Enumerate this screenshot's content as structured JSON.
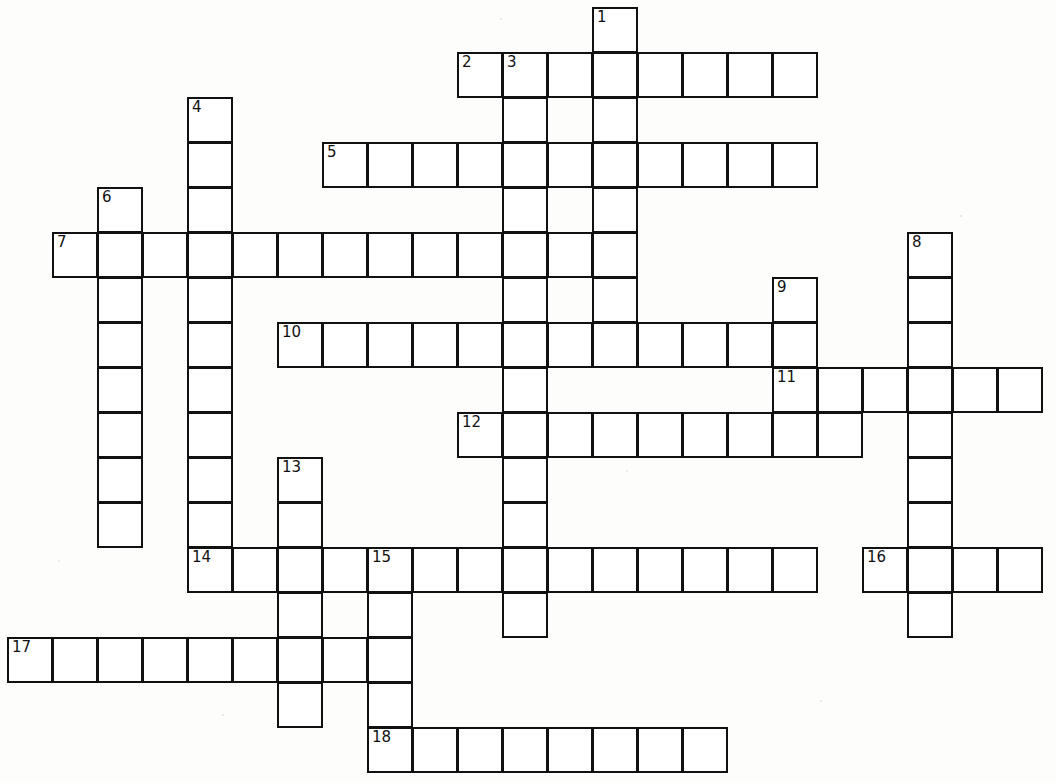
{
  "puzzle": {
    "type": "crossword-grid",
    "title": "",
    "grid": {
      "origin_x": 7,
      "origin_y": 7,
      "cell_size": 45,
      "cols": 23,
      "rows": 17,
      "line_color": "#111111",
      "cell_fill": "#ffffff",
      "background": "#fdfdfc"
    },
    "entries": [
      {
        "number": "1",
        "direction": "down",
        "row": 0,
        "col": 13,
        "length": 6
      },
      {
        "number": "2",
        "direction": "across",
        "row": 1,
        "col": 10,
        "length": 8
      },
      {
        "number": "3",
        "direction": "down",
        "row": 1,
        "col": 11,
        "length": 13
      },
      {
        "number": "4",
        "direction": "down",
        "row": 2,
        "col": 4,
        "length": 10
      },
      {
        "number": "5",
        "direction": "across",
        "row": 3,
        "col": 7,
        "length": 11
      },
      {
        "number": "6",
        "direction": "down",
        "row": 4,
        "col": 2,
        "length": 8
      },
      {
        "number": "7",
        "direction": "across",
        "row": 5,
        "col": 1,
        "length": 12
      },
      {
        "number": "8",
        "direction": "down",
        "row": 5,
        "col": 20,
        "length": 9
      },
      {
        "number": "9",
        "direction": "down",
        "row": 6,
        "col": 17,
        "length": 4
      },
      {
        "number": "10",
        "direction": "across",
        "row": 7,
        "col": 6,
        "length": 11
      },
      {
        "number": "11",
        "direction": "across",
        "row": 8,
        "col": 17,
        "length": 6
      },
      {
        "number": "12",
        "direction": "across",
        "row": 9,
        "col": 10,
        "length": 9
      },
      {
        "number": "13",
        "direction": "down",
        "row": 10,
        "col": 6,
        "length": 6
      },
      {
        "number": "14",
        "direction": "across",
        "row": 12,
        "col": 4,
        "length": 4
      },
      {
        "number": "15",
        "direction": "across",
        "row": 12,
        "col": 8,
        "length": 10
      },
      {
        "number": "15",
        "direction": "down",
        "row": 12,
        "col": 8,
        "length": 5
      },
      {
        "number": "16",
        "direction": "across",
        "row": 12,
        "col": 19,
        "length": 3
      },
      {
        "number": "17",
        "direction": "across",
        "row": 14,
        "col": 0,
        "length": 8
      },
      {
        "number": "18",
        "direction": "across",
        "row": 16,
        "col": 8,
        "length": 8
      }
    ],
    "cells": [
      {
        "row": 0,
        "col": 13,
        "num": "1"
      },
      {
        "row": 1,
        "col": 10,
        "num": "2"
      },
      {
        "row": 1,
        "col": 11,
        "num": "3"
      },
      {
        "row": 1,
        "col": 12,
        "num": ""
      },
      {
        "row": 1,
        "col": 13,
        "num": ""
      },
      {
        "row": 1,
        "col": 14,
        "num": ""
      },
      {
        "row": 1,
        "col": 15,
        "num": ""
      },
      {
        "row": 1,
        "col": 16,
        "num": ""
      },
      {
        "row": 1,
        "col": 17,
        "num": ""
      },
      {
        "row": 2,
        "col": 4,
        "num": "4"
      },
      {
        "row": 2,
        "col": 11,
        "num": ""
      },
      {
        "row": 2,
        "col": 13,
        "num": ""
      },
      {
        "row": 3,
        "col": 4,
        "num": ""
      },
      {
        "row": 3,
        "col": 7,
        "num": "5"
      },
      {
        "row": 3,
        "col": 8,
        "num": ""
      },
      {
        "row": 3,
        "col": 9,
        "num": ""
      },
      {
        "row": 3,
        "col": 10,
        "num": ""
      },
      {
        "row": 3,
        "col": 11,
        "num": ""
      },
      {
        "row": 3,
        "col": 12,
        "num": ""
      },
      {
        "row": 3,
        "col": 13,
        "num": ""
      },
      {
        "row": 3,
        "col": 14,
        "num": ""
      },
      {
        "row": 3,
        "col": 15,
        "num": ""
      },
      {
        "row": 3,
        "col": 16,
        "num": ""
      },
      {
        "row": 3,
        "col": 17,
        "num": ""
      },
      {
        "row": 4,
        "col": 2,
        "num": "6"
      },
      {
        "row": 4,
        "col": 4,
        "num": ""
      },
      {
        "row": 4,
        "col": 11,
        "num": ""
      },
      {
        "row": 4,
        "col": 13,
        "num": ""
      },
      {
        "row": 5,
        "col": 1,
        "num": "7"
      },
      {
        "row": 5,
        "col": 2,
        "num": ""
      },
      {
        "row": 5,
        "col": 3,
        "num": ""
      },
      {
        "row": 5,
        "col": 4,
        "num": ""
      },
      {
        "row": 5,
        "col": 5,
        "num": ""
      },
      {
        "row": 5,
        "col": 6,
        "num": ""
      },
      {
        "row": 5,
        "col": 7,
        "num": ""
      },
      {
        "row": 5,
        "col": 8,
        "num": ""
      },
      {
        "row": 5,
        "col": 9,
        "num": ""
      },
      {
        "row": 5,
        "col": 10,
        "num": ""
      },
      {
        "row": 5,
        "col": 11,
        "num": ""
      },
      {
        "row": 5,
        "col": 12,
        "num": ""
      },
      {
        "row": 5,
        "col": 13,
        "num": ""
      },
      {
        "row": 5,
        "col": 20,
        "num": "8"
      },
      {
        "row": 6,
        "col": 2,
        "num": ""
      },
      {
        "row": 6,
        "col": 4,
        "num": ""
      },
      {
        "row": 6,
        "col": 11,
        "num": ""
      },
      {
        "row": 6,
        "col": 13,
        "num": ""
      },
      {
        "row": 6,
        "col": 17,
        "num": "9"
      },
      {
        "row": 6,
        "col": 20,
        "num": ""
      },
      {
        "row": 7,
        "col": 2,
        "num": ""
      },
      {
        "row": 7,
        "col": 4,
        "num": ""
      },
      {
        "row": 7,
        "col": 6,
        "num": "10"
      },
      {
        "row": 7,
        "col": 7,
        "num": ""
      },
      {
        "row": 7,
        "col": 8,
        "num": ""
      },
      {
        "row": 7,
        "col": 9,
        "num": ""
      },
      {
        "row": 7,
        "col": 10,
        "num": ""
      },
      {
        "row": 7,
        "col": 11,
        "num": ""
      },
      {
        "row": 7,
        "col": 12,
        "num": ""
      },
      {
        "row": 7,
        "col": 13,
        "num": ""
      },
      {
        "row": 7,
        "col": 14,
        "num": ""
      },
      {
        "row": 7,
        "col": 15,
        "num": ""
      },
      {
        "row": 7,
        "col": 16,
        "num": ""
      },
      {
        "row": 7,
        "col": 17,
        "num": ""
      },
      {
        "row": 7,
        "col": 20,
        "num": ""
      },
      {
        "row": 8,
        "col": 2,
        "num": ""
      },
      {
        "row": 8,
        "col": 4,
        "num": ""
      },
      {
        "row": 8,
        "col": 11,
        "num": ""
      },
      {
        "row": 8,
        "col": 17,
        "num": "11"
      },
      {
        "row": 8,
        "col": 18,
        "num": ""
      },
      {
        "row": 8,
        "col": 19,
        "num": ""
      },
      {
        "row": 8,
        "col": 20,
        "num": ""
      },
      {
        "row": 8,
        "col": 21,
        "num": ""
      },
      {
        "row": 8,
        "col": 22,
        "num": ""
      },
      {
        "row": 9,
        "col": 2,
        "num": ""
      },
      {
        "row": 9,
        "col": 4,
        "num": ""
      },
      {
        "row": 9,
        "col": 10,
        "num": "12"
      },
      {
        "row": 9,
        "col": 11,
        "num": ""
      },
      {
        "row": 9,
        "col": 12,
        "num": ""
      },
      {
        "row": 9,
        "col": 13,
        "num": ""
      },
      {
        "row": 9,
        "col": 14,
        "num": ""
      },
      {
        "row": 9,
        "col": 15,
        "num": ""
      },
      {
        "row": 9,
        "col": 16,
        "num": ""
      },
      {
        "row": 9,
        "col": 17,
        "num": ""
      },
      {
        "row": 9,
        "col": 18,
        "num": ""
      },
      {
        "row": 9,
        "col": 20,
        "num": ""
      },
      {
        "row": 10,
        "col": 2,
        "num": ""
      },
      {
        "row": 10,
        "col": 4,
        "num": ""
      },
      {
        "row": 10,
        "col": 6,
        "num": "13"
      },
      {
        "row": 10,
        "col": 11,
        "num": ""
      },
      {
        "row": 10,
        "col": 20,
        "num": ""
      },
      {
        "row": 11,
        "col": 2,
        "num": ""
      },
      {
        "row": 11,
        "col": 4,
        "num": ""
      },
      {
        "row": 11,
        "col": 6,
        "num": ""
      },
      {
        "row": 11,
        "col": 11,
        "num": ""
      },
      {
        "row": 11,
        "col": 20,
        "num": ""
      },
      {
        "row": 12,
        "col": 4,
        "num": "14"
      },
      {
        "row": 12,
        "col": 5,
        "num": ""
      },
      {
        "row": 12,
        "col": 6,
        "num": ""
      },
      {
        "row": 12,
        "col": 7,
        "num": ""
      },
      {
        "row": 12,
        "col": 8,
        "num": "15"
      },
      {
        "row": 12,
        "col": 9,
        "num": ""
      },
      {
        "row": 12,
        "col": 10,
        "num": ""
      },
      {
        "row": 12,
        "col": 11,
        "num": ""
      },
      {
        "row": 12,
        "col": 12,
        "num": ""
      },
      {
        "row": 12,
        "col": 13,
        "num": ""
      },
      {
        "row": 12,
        "col": 14,
        "num": ""
      },
      {
        "row": 12,
        "col": 15,
        "num": ""
      },
      {
        "row": 12,
        "col": 16,
        "num": ""
      },
      {
        "row": 12,
        "col": 17,
        "num": ""
      },
      {
        "row": 12,
        "col": 19,
        "num": "16"
      },
      {
        "row": 12,
        "col": 20,
        "num": ""
      },
      {
        "row": 12,
        "col": 21,
        "num": ""
      },
      {
        "row": 12,
        "col": 22,
        "num": ""
      },
      {
        "row": 13,
        "col": 6,
        "num": ""
      },
      {
        "row": 13,
        "col": 8,
        "num": ""
      },
      {
        "row": 13,
        "col": 11,
        "num": ""
      },
      {
        "row": 13,
        "col": 20,
        "num": ""
      },
      {
        "row": 14,
        "col": 0,
        "num": "17"
      },
      {
        "row": 14,
        "col": 1,
        "num": ""
      },
      {
        "row": 14,
        "col": 2,
        "num": ""
      },
      {
        "row": 14,
        "col": 3,
        "num": ""
      },
      {
        "row": 14,
        "col": 4,
        "num": ""
      },
      {
        "row": 14,
        "col": 5,
        "num": ""
      },
      {
        "row": 14,
        "col": 6,
        "num": ""
      },
      {
        "row": 14,
        "col": 7,
        "num": ""
      },
      {
        "row": 14,
        "col": 8,
        "num": ""
      },
      {
        "row": 15,
        "col": 6,
        "num": ""
      },
      {
        "row": 15,
        "col": 8,
        "num": ""
      },
      {
        "row": 16,
        "col": 8,
        "num": "18"
      },
      {
        "row": 16,
        "col": 9,
        "num": ""
      },
      {
        "row": 16,
        "col": 10,
        "num": ""
      },
      {
        "row": 16,
        "col": 11,
        "num": ""
      },
      {
        "row": 16,
        "col": 12,
        "num": ""
      },
      {
        "row": 16,
        "col": 13,
        "num": ""
      },
      {
        "row": 16,
        "col": 14,
        "num": ""
      },
      {
        "row": 16,
        "col": 15,
        "num": ""
      }
    ],
    "specks": [
      {
        "x": 138,
        "y": 262
      },
      {
        "x": 288,
        "y": 648
      },
      {
        "x": 330,
        "y": 258
      },
      {
        "x": 500,
        "y": 18
      },
      {
        "x": 960,
        "y": 215
      },
      {
        "x": 626,
        "y": 470
      },
      {
        "x": 222,
        "y": 714
      },
      {
        "x": 820,
        "y": 700
      },
      {
        "x": 58,
        "y": 560
      }
    ]
  }
}
